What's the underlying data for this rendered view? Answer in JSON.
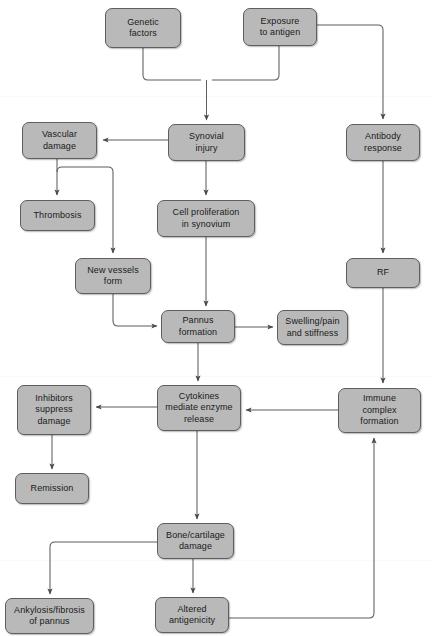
{
  "diagram": {
    "type": "flowchart",
    "width": 432,
    "height": 636,
    "colors": {
      "node_fill": "#b9b9b9",
      "node_border": "#5e5e5e",
      "edge_stroke": "#595959",
      "text": "#1a1a1a",
      "background": "#ffffff"
    },
    "corner_artifact": "",
    "nodes": [
      {
        "id": "genetic_factors",
        "label": "Genetic\nfactors",
        "x": 105,
        "y": 8,
        "w": 76,
        "h": 40
      },
      {
        "id": "exposure_antigen",
        "label": "Exposure\nto antigen",
        "x": 243,
        "y": 8,
        "w": 74,
        "h": 38
      },
      {
        "id": "vascular_damage",
        "label": "Vascular\ndamage",
        "x": 22,
        "y": 122,
        "w": 75,
        "h": 37
      },
      {
        "id": "synovial_injury",
        "label": "Synovial\ninjury",
        "x": 168,
        "y": 124,
        "w": 77,
        "h": 37
      },
      {
        "id": "antibody_response",
        "label": "Antibody\nresponse",
        "x": 346,
        "y": 124,
        "w": 74,
        "h": 37
      },
      {
        "id": "thrombosis",
        "label": "Thrombosis",
        "x": 20,
        "y": 200,
        "w": 75,
        "h": 31
      },
      {
        "id": "cell_proliferation",
        "label": "Cell proliferation\nin synovium",
        "x": 157,
        "y": 200,
        "w": 98,
        "h": 37
      },
      {
        "id": "new_vessels",
        "label": "New vessels\nform",
        "x": 75,
        "y": 258,
        "w": 76,
        "h": 36
      },
      {
        "id": "rf",
        "label": "RF",
        "x": 346,
        "y": 258,
        "w": 74,
        "h": 30
      },
      {
        "id": "pannus_formation",
        "label": "Pannus\nformation",
        "x": 161,
        "y": 310,
        "w": 74,
        "h": 33
      },
      {
        "id": "swelling_pain",
        "label": "Swelling/pain\nand stiffness",
        "x": 277,
        "y": 310,
        "w": 71,
        "h": 35
      },
      {
        "id": "inhibitors",
        "label": "Inhibitors\nsuppress\ndamage",
        "x": 17,
        "y": 385,
        "w": 74,
        "h": 50
      },
      {
        "id": "cytokines",
        "label": "Cytokines\nmediate enzyme\nrelease",
        "x": 157,
        "y": 385,
        "w": 84,
        "h": 46
      },
      {
        "id": "immune_complex",
        "label": "Immune\ncomplex\nformation",
        "x": 338,
        "y": 388,
        "w": 83,
        "h": 45
      },
      {
        "id": "remission",
        "label": "Remission",
        "x": 15,
        "y": 473,
        "w": 74,
        "h": 31
      },
      {
        "id": "bone_cartilage",
        "label": "Bone/cartilage\ndamage",
        "x": 157,
        "y": 523,
        "w": 77,
        "h": 36
      },
      {
        "id": "ankylosis",
        "label": "Ankylosis/fibrosis\nof pannus",
        "x": 5,
        "y": 598,
        "w": 89,
        "h": 36
      },
      {
        "id": "altered_antigen",
        "label": "Altered\nantigenicity",
        "x": 155,
        "y": 597,
        "w": 74,
        "h": 36
      }
    ],
    "edges": [
      {
        "from": "genetic_factors",
        "to": "synovial_injury",
        "style": "elbow-merge-down"
      },
      {
        "from": "exposure_antigen",
        "to": "synovial_injury",
        "style": "elbow-merge-down"
      },
      {
        "from": "exposure_antigen",
        "to": "antibody_response",
        "style": "right-then-down"
      },
      {
        "from": "synovial_injury",
        "to": "vascular_damage",
        "style": "straight-left"
      },
      {
        "from": "synovial_injury",
        "to": "cell_proliferation",
        "style": "straight-down"
      },
      {
        "from": "vascular_damage",
        "to": "thrombosis",
        "style": "straight-down"
      },
      {
        "from": "vascular_damage",
        "to": "new_vessels",
        "style": "elbow-right-down"
      },
      {
        "from": "cell_proliferation",
        "to": "pannus_formation",
        "style": "straight-down"
      },
      {
        "from": "new_vessels",
        "to": "pannus_formation",
        "style": "elbow-down-right"
      },
      {
        "from": "antibody_response",
        "to": "rf",
        "style": "straight-down"
      },
      {
        "from": "rf",
        "to": "immune_complex",
        "style": "straight-down"
      },
      {
        "from": "pannus_formation",
        "to": "swelling_pain",
        "style": "straight-right"
      },
      {
        "from": "pannus_formation",
        "to": "cytokines",
        "style": "straight-down"
      },
      {
        "from": "immune_complex",
        "to": "cytokines",
        "style": "straight-left"
      },
      {
        "from": "cytokines",
        "to": "inhibitors",
        "style": "straight-left"
      },
      {
        "from": "cytokines",
        "to": "bone_cartilage",
        "style": "straight-down"
      },
      {
        "from": "inhibitors",
        "to": "remission",
        "style": "straight-down"
      },
      {
        "from": "bone_cartilage",
        "to": "ankylosis",
        "style": "elbow-left-down"
      },
      {
        "from": "bone_cartilage",
        "to": "altered_antigen",
        "style": "straight-down"
      },
      {
        "from": "altered_antigen",
        "to": "immune_complex",
        "style": "right-then-up"
      }
    ]
  }
}
